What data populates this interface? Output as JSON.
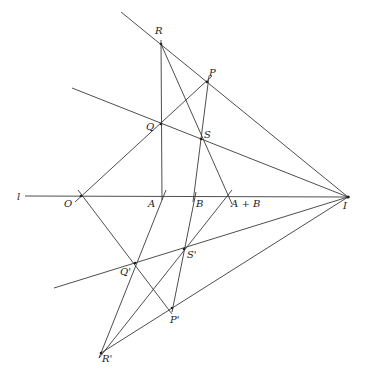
{
  "diagram": {
    "line_label": "l",
    "points": {
      "R": {
        "label": "R",
        "x": 161,
        "y": 44
      },
      "P": {
        "label": "P",
        "x": 207,
        "y": 82
      },
      "Q": {
        "label": "Q",
        "x": 161,
        "y": 124
      },
      "S": {
        "label": "S",
        "x": 201,
        "y": 139
      },
      "O": {
        "label": "O",
        "x": 81,
        "y": 196
      },
      "A": {
        "label": "A",
        "x": 162,
        "y": 196
      },
      "B": {
        "label": "B",
        "x": 194,
        "y": 196
      },
      "AB": {
        "label": "A + B",
        "x": 228,
        "y": 196
      },
      "I": {
        "label": "I",
        "x": 348,
        "y": 197
      },
      "Sp": {
        "label": "S'",
        "x": 184,
        "y": 249
      },
      "Qp": {
        "label": "Q'",
        "x": 135,
        "y": 263
      },
      "Pp": {
        "label": "P'",
        "x": 172,
        "y": 308
      },
      "Rp": {
        "label": "R'",
        "x": 101,
        "y": 353
      }
    }
  }
}
